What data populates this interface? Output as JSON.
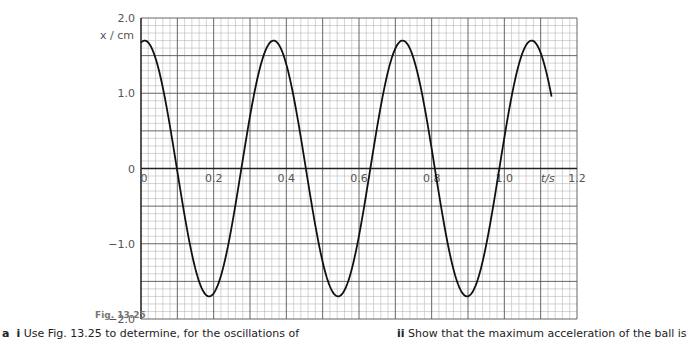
{
  "chart_data": {
    "type": "line",
    "title": "",
    "xlabel": "t/s",
    "ylabel": "x / cm",
    "xlim": [
      0,
      1.2
    ],
    "ylim": [
      -2.0,
      2.0
    ],
    "x_ticks": [
      "0",
      "0.2",
      "0.4",
      "0.6",
      "0.8",
      "1.0",
      "1.2"
    ],
    "x_tick_values": [
      0,
      0.2,
      0.4,
      0.6,
      0.8,
      1.0,
      1.2
    ],
    "y_ticks": [
      "2.0",
      "1.0",
      "0",
      "-1.0",
      "-2.0"
    ],
    "y_tick_values": [
      2.0,
      1.0,
      0,
      -1.0,
      -2.0
    ],
    "grid": true,
    "grid_minor_x": 0.02,
    "grid_minor_y": 0.1,
    "grid_major_x": 0.1,
    "grid_major_y": 0.5,
    "series": [
      {
        "name": "displacement",
        "model": "x = A cos(2π(t - t0)/T)",
        "amplitude": 1.7,
        "period": 0.355,
        "t0": 0.01,
        "t_start": 0.0,
        "t_end": 1.13,
        "key_points": [
          {
            "t": 0.0,
            "x": 1.68
          },
          {
            "t": 0.1,
            "x": 0.0
          },
          {
            "t": 0.2,
            "x": -1.7
          },
          {
            "t": 0.28,
            "x": 0.0
          },
          {
            "t": 0.36,
            "x": 1.7
          },
          {
            "t": 0.45,
            "x": 0.0
          },
          {
            "t": 0.55,
            "x": -1.7
          },
          {
            "t": 0.63,
            "x": 0.0
          },
          {
            "t": 0.72,
            "x": 1.7
          },
          {
            "t": 0.81,
            "x": 0.0
          },
          {
            "t": 0.9,
            "x": -1.7
          },
          {
            "t": 0.99,
            "x": 0.0
          },
          {
            "t": 1.08,
            "x": 1.7
          },
          {
            "t": 1.13,
            "x": 0.95
          }
        ]
      }
    ]
  },
  "caption": {
    "figure_label": "Fig. 13.25",
    "q_a_label": "a",
    "q_i_label": "i",
    "q_i_text": "Use Fig. 13.25 to determine, for the oscillations of",
    "q_ii_label": "ii",
    "q_ii_text": "Show that the maximum acceleration of the ball is"
  }
}
